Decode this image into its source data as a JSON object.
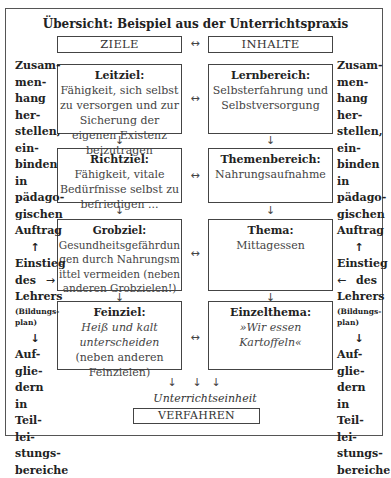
{
  "title": "Übersicht: Beispiel aus der Unterrichtspraxis",
  "headers": {
    "left": "ZIELE",
    "right": "INHALTE",
    "link": "↔"
  },
  "ziele": [
    {
      "heading": "Leitziel:",
      "text": "Fähigkeit, sich selbst zu versorgen und zur Sicherung der eigenen Existenz beizutragen"
    },
    {
      "heading": "Richtziel:",
      "text": "Fähigkeit, vitale Bedürfnisse selbst zu befriedigen ..."
    },
    {
      "heading": "Grobziel:",
      "text": "Gesundheitsgefährdungen durch Nahrungsmittel vermeiden (neben anderen Grobzielen!)"
    },
    {
      "heading": "Feinziel:",
      "italic": "Heiß und kalt unterscheiden",
      "text": "(neben anderen Feinzielen)"
    }
  ],
  "inhalte": [
    {
      "heading": "Lernbereich:",
      "text": "Selbsterfahrung und Selbstversorgung"
    },
    {
      "heading": "Themenbereich:",
      "text": "Nahrungsaufnahme"
    },
    {
      "heading": "Thema:",
      "text": "Mittagessen"
    },
    {
      "heading": "Einzelthema:",
      "italic": "»Wir essen Kartoffeln«"
    }
  ],
  "side": {
    "top_lines": [
      "Zusam-",
      "men-",
      "hang",
      "her-",
      "stellen,",
      "ein-",
      "binden",
      "in",
      "pädago-",
      "gischen",
      "Auftrag"
    ],
    "up_arrow": "↑",
    "einstieg": "Einstieg",
    "des": "des",
    "lehrers": "Lehrers",
    "bildungsplan": "(Bildungs-plan)",
    "arrow_right": "→",
    "arrow_left": "←",
    "down_arrow": "↓",
    "bottom_lines": [
      "Auf-",
      "glie-",
      "dern",
      "in",
      "Teil-",
      "lei-",
      "stungs-",
      "bereiche"
    ]
  },
  "arrows": {
    "down": "↓",
    "link": "↔"
  },
  "unterrichtseinheit": "Unterrichtseinheit",
  "verfahren": "VERFAHREN"
}
